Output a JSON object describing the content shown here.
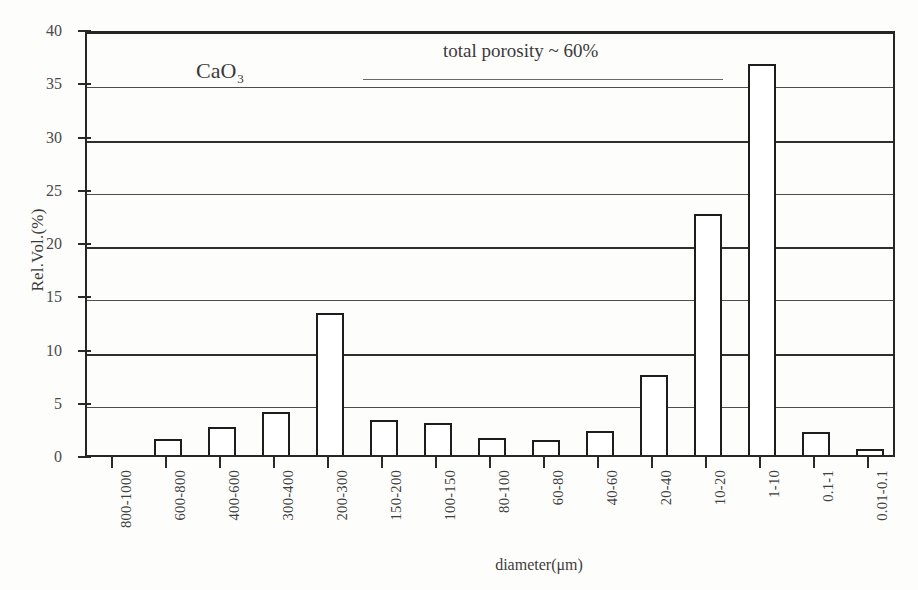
{
  "chart_data": {
    "type": "bar",
    "title": "",
    "xlabel": "diameter(μm)",
    "ylabel": "Rel.Vol.(%)",
    "ylim": [
      0,
      40
    ],
    "ytick_step": 5,
    "yticks": [
      0,
      5,
      10,
      15,
      20,
      25,
      30,
      35,
      40
    ],
    "grid": "horizontal",
    "legend": "none",
    "categories": [
      "800-1000",
      "600-800",
      "400-600",
      "300-400",
      "200-300",
      "150-200",
      "100-150",
      "80-100",
      "60-80",
      "40-60",
      "20-40",
      "10-20",
      "1-10",
      "0.1-1",
      "0.01-0.1"
    ],
    "values": [
      0,
      1.5,
      2.6,
      4.0,
      13.3,
      3.3,
      3.0,
      1.6,
      1.4,
      2.3,
      7.5,
      22.6,
      36.7,
      2.2,
      0.6
    ],
    "series": [
      {
        "name": "Rel.Vol.(%)",
        "values": [
          0,
          1.5,
          2.6,
          4.0,
          13.3,
          3.3,
          3.0,
          1.6,
          1.4,
          2.3,
          7.5,
          22.6,
          36.7,
          2.2,
          0.6
        ]
      }
    ],
    "annotations": [
      {
        "name": "sample",
        "text_main": "CaO",
        "text_sub": "3"
      },
      {
        "name": "porosity",
        "text": "total porosity ~ 60%"
      }
    ]
  },
  "axes": {
    "y_title": "Rel.Vol.(%)",
    "x_title": "diameter(μm)"
  },
  "annotations": {
    "sample_main": "CaO",
    "sample_sub": "3",
    "porosity": "total porosity ~ 60%"
  },
  "style": {
    "bar_fill": "#ffffff",
    "bar_stroke": "#1d1d1d",
    "axis_color": "#262626",
    "grid_color": "#4d4d4d",
    "text_color": "#3a3a3a",
    "background": "#fdfdfc"
  }
}
